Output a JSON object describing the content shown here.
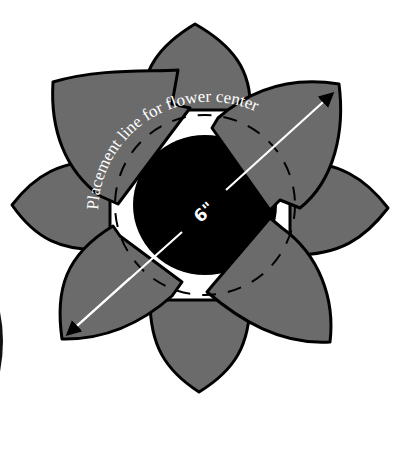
{
  "diagram": {
    "type": "flower-applique-pattern",
    "placement_label": "Placement line for flower center",
    "dimension_label": "6\"",
    "colors": {
      "petal": "#6b6b6b",
      "outline": "#000000",
      "center": "#000000",
      "arrow": "#ffffff",
      "background": "#ffffff"
    },
    "elements": {
      "outer_petals": [
        "top",
        "right",
        "bottom",
        "left"
      ],
      "wedge_petals": [
        "upper-left",
        "upper-right",
        "lower-left",
        "lower-right"
      ],
      "center": "black flower center",
      "placement_circle": "dashed circle",
      "measurement_arrow": "double-headed arrow across diagonal"
    }
  }
}
